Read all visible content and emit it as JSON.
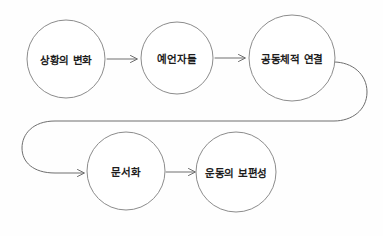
{
  "diagram": {
    "type": "flowchart",
    "title": "",
    "background_color": "#fefefe",
    "node_stroke_color": "#8c8c8c",
    "connector_color": "#6e6e6e",
    "label_color": "#1d1d1d",
    "nodes": [
      {
        "id": "node-1",
        "label": "상황의 변화",
        "shape": "circle",
        "cx": 66,
        "cy": 59,
        "r": 39,
        "row": 1
      },
      {
        "id": "node-2",
        "label": "예언자들",
        "shape": "circle",
        "cx": 177,
        "cy": 58,
        "r": 36,
        "row": 1
      },
      {
        "id": "node-3",
        "label": "공동체적 연결",
        "shape": "circle",
        "cx": 292,
        "cy": 58,
        "r": 43,
        "row": 1
      },
      {
        "id": "node-4",
        "label": "문서화",
        "shape": "circle",
        "cx": 126,
        "cy": 171,
        "r": 39,
        "row": 2
      },
      {
        "id": "node-5",
        "label": "운동의 보편성",
        "shape": "circle",
        "cx": 236,
        "cy": 172,
        "r": 40,
        "row": 2
      }
    ],
    "connectors": [
      {
        "id": "edge-1-2",
        "from": "node-1",
        "to": "node-2",
        "style": "straight-arrow",
        "direction": "right"
      },
      {
        "id": "edge-2-3",
        "from": "node-2",
        "to": "node-3",
        "style": "straight-arrow",
        "direction": "right"
      },
      {
        "id": "edge-3-4",
        "from": "node-3",
        "to": "node-4",
        "style": "wrap-around-arrow",
        "direction": "right-down-left-right"
      },
      {
        "id": "edge-4-5",
        "from": "node-4",
        "to": "node-5",
        "style": "straight-arrow",
        "direction": "right"
      }
    ]
  }
}
